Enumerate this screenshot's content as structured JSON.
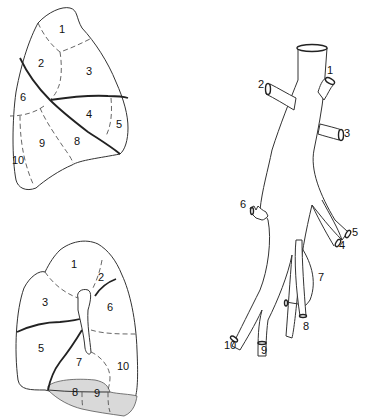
{
  "figure": {
    "upper_lung": {
      "view": "lateral",
      "segments": [
        {
          "id": "1",
          "label": "1",
          "x": 59,
          "y": 33
        },
        {
          "id": "2",
          "label": "2",
          "x": 38,
          "y": 67
        },
        {
          "id": "3",
          "label": "3",
          "x": 86,
          "y": 75
        },
        {
          "id": "4",
          "label": "4",
          "x": 86,
          "y": 118
        },
        {
          "id": "5",
          "label": "5",
          "x": 116,
          "y": 128
        },
        {
          "id": "6",
          "label": "6",
          "x": 20,
          "y": 101
        },
        {
          "id": "8",
          "label": "8",
          "x": 74,
          "y": 145
        },
        {
          "id": "9",
          "label": "9",
          "x": 39,
          "y": 147
        },
        {
          "id": "10",
          "label": "10",
          "x": 12,
          "y": 164
        }
      ]
    },
    "lower_lung": {
      "view": "medial",
      "segments": [
        {
          "id": "1",
          "label": "1",
          "x": 71,
          "y": 268
        },
        {
          "id": "2",
          "label": "2",
          "x": 98,
          "y": 281
        },
        {
          "id": "3",
          "label": "3",
          "x": 42,
          "y": 306
        },
        {
          "id": "6",
          "label": "6",
          "x": 107,
          "y": 311
        },
        {
          "id": "5",
          "label": "5",
          "x": 38,
          "y": 352
        },
        {
          "id": "7",
          "label": "7",
          "x": 76,
          "y": 366
        },
        {
          "id": "10",
          "label": "10",
          "x": 117,
          "y": 370
        },
        {
          "id": "8",
          "label": "8",
          "x": 72,
          "y": 396
        },
        {
          "id": "9",
          "label": "9",
          "x": 94,
          "y": 397
        }
      ]
    },
    "bronchial_tree": {
      "branches": [
        {
          "id": "1",
          "label": "1",
          "x": 327,
          "y": 74
        },
        {
          "id": "2",
          "label": "2",
          "x": 258,
          "y": 88
        },
        {
          "id": "3",
          "label": "3",
          "x": 344,
          "y": 137
        },
        {
          "id": "6",
          "label": "6",
          "x": 240,
          "y": 236
        },
        {
          "id": "5",
          "label": "5",
          "x": 352,
          "y": 236
        },
        {
          "id": "4",
          "label": "4",
          "x": 339,
          "y": 247
        },
        {
          "id": "7",
          "label": "7",
          "x": 318,
          "y": 281
        },
        {
          "id": "8",
          "label": "8",
          "x": 303,
          "y": 330
        },
        {
          "id": "9",
          "label": "9",
          "x": 261,
          "y": 354
        },
        {
          "id": "10",
          "label": "10",
          "x": 224,
          "y": 349
        }
      ]
    },
    "colors": {
      "line": "#333333",
      "shade": "#d9d9d9",
      "background": "#ffffff"
    }
  }
}
